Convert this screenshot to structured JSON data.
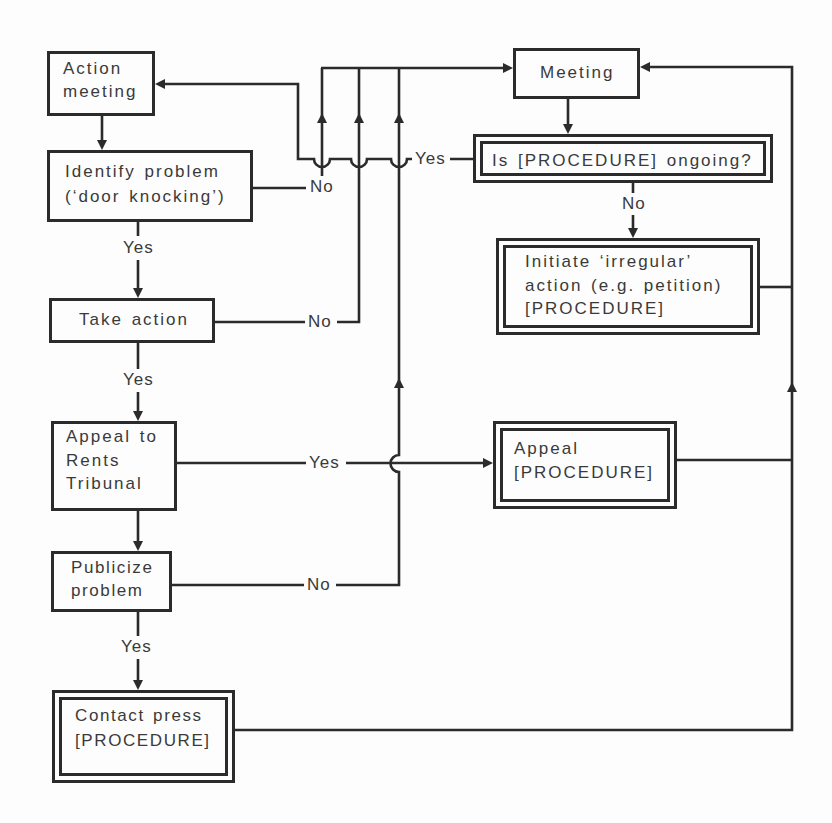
{
  "diagram": {
    "nodes": {
      "action_meeting": {
        "lines": [
          "Action",
          "meeting"
        ]
      },
      "identify_problem": {
        "lines": [
          "Identify problem",
          "(‘door knocking’)"
        ]
      },
      "take_action": {
        "lines": [
          "Take action"
        ]
      },
      "appeal_rents_tribunal": {
        "lines": [
          "Appeal to",
          "Rents",
          "Tribunal"
        ]
      },
      "publicize_problem": {
        "lines": [
          "Publicize",
          "problem"
        ]
      },
      "contact_press": {
        "lines": [
          "Contact press",
          "[PROCEDURE]"
        ]
      },
      "meeting": {
        "lines": [
          "Meeting"
        ]
      },
      "is_procedure_ongoing": {
        "lines": [
          "Is [PROCEDURE] ongoing?"
        ]
      },
      "initiate_irregular_action": {
        "lines": [
          "Initiate ‘irregular’",
          "action (e.g. petition)",
          "[PROCEDURE]"
        ]
      },
      "appeal_procedure": {
        "lines": [
          "Appeal",
          "[PROCEDURE]"
        ]
      }
    },
    "edges": [
      {
        "from": "action_meeting",
        "to": "identify_problem",
        "label": ""
      },
      {
        "from": "identify_problem",
        "to": "take_action",
        "label": "Yes"
      },
      {
        "from": "identify_problem",
        "to": "meeting",
        "label": "No"
      },
      {
        "from": "take_action",
        "to": "appeal_rents_tribunal",
        "label": "Yes"
      },
      {
        "from": "take_action",
        "to": "meeting",
        "label": "No"
      },
      {
        "from": "appeal_rents_tribunal",
        "to": "publicize_problem",
        "label": ""
      },
      {
        "from": "appeal_rents_tribunal",
        "to": "appeal_procedure",
        "label": "Yes"
      },
      {
        "from": "publicize_problem",
        "to": "contact_press",
        "label": "Yes"
      },
      {
        "from": "publicize_problem",
        "to": "meeting",
        "label": "No"
      },
      {
        "from": "meeting",
        "to": "is_procedure_ongoing",
        "label": ""
      },
      {
        "from": "is_procedure_ongoing",
        "to": "action_meeting",
        "label": "Yes"
      },
      {
        "from": "is_procedure_ongoing",
        "to": "initiate_irregular_action",
        "label": "No"
      },
      {
        "from": "initiate_irregular_action",
        "to": "meeting",
        "label": ""
      },
      {
        "from": "appeal_procedure",
        "to": "meeting",
        "label": ""
      },
      {
        "from": "contact_press",
        "to": "meeting",
        "label": ""
      }
    ]
  },
  "colors": {
    "line": "#2b2b2b",
    "text": "#3a3a3a",
    "background": "#fdfdfd"
  }
}
